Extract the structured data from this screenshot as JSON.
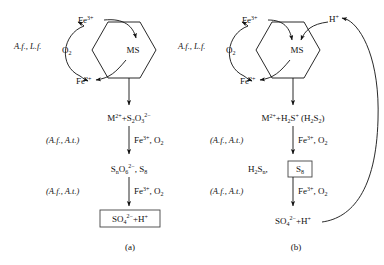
{
  "figure": {
    "caption_a": "(a)",
    "caption_b": "(b)",
    "ms_label": "MS"
  },
  "panel_a": {
    "organisms_cycle": "A.f., L.f.",
    "fe3": "Fe",
    "fe3_sup": "3+",
    "fe2": "Fe",
    "fe2_sup": "2+",
    "o2": "O",
    "o2_sub": "2",
    "step1": {
      "m": "M",
      "m_sup": "2+",
      "plus": "+S",
      "s_sub": "2",
      "o": "O",
      "o_sub": "3",
      "o_sup": "2−"
    },
    "catalyst1_organisms": "(A.f., A.t.)",
    "catalyst1_oxidant": "Fe",
    "catalyst1_oxidant_sup": "3+",
    "catalyst1_oxidant2": ", O",
    "catalyst1_oxidant2_sub": "2",
    "step2": {
      "s": "S",
      "s_sub": "n",
      "o": "O",
      "o_sub": "6",
      "o_sup": "2−",
      "comma": ", S",
      "s8_sub": "8"
    },
    "catalyst2_organisms": "(A.f., A.t.)",
    "catalyst2_oxidant": "Fe",
    "catalyst2_oxidant_sup": "3+",
    "catalyst2_oxidant2": ", O",
    "catalyst2_oxidant2_sub": "2",
    "product": {
      "so4": "SO",
      "so4_sub": "4",
      "so4_sup": "2−",
      "plus_h": "+H",
      "h_sup": "+"
    }
  },
  "panel_b": {
    "organisms_cycle": "A.f., L.f.",
    "fe3": "Fe",
    "fe3_sup": "3+",
    "fe2": "Fe",
    "fe2_sup": "2+",
    "o2": "O",
    "o2_sub": "2",
    "proton": "H",
    "proton_sup": "+",
    "step1": {
      "m": "M",
      "m_sup": "2+",
      "plus": "+H",
      "h_sub": "2",
      "s": "S",
      "s_sup": "+",
      "paren_open": " (H",
      "p_sub": "2",
      "p_s": "S",
      "p_s_sub": "2",
      "paren_close": ")"
    },
    "catalyst1_organisms": "(A.f., A.t.)",
    "catalyst1_oxidant": "Fe",
    "catalyst1_oxidant_sup": "3+",
    "catalyst1_oxidant2": ", O",
    "catalyst1_oxidant2_sub": "2",
    "step2": {
      "h": "H",
      "h_sub": "2",
      "s": "S",
      "s_sub": "n",
      "comma": ",",
      "s8": "S",
      "s8_sub": "8"
    },
    "catalyst2_organisms": "(A.f., A.t.)",
    "catalyst2_oxidant": "Fe",
    "catalyst2_oxidant_sup": "3+",
    "catalyst2_oxidant2": ", O",
    "catalyst2_oxidant2_sub": "2",
    "product": {
      "so4": "SO",
      "so4_sub": "4",
      "so4_sup": "2−",
      "plus_h": "+H",
      "h_sup": "+"
    }
  },
  "colors": {
    "ink": "#111111",
    "box_stroke": "#444444",
    "background": "#ffffff"
  }
}
